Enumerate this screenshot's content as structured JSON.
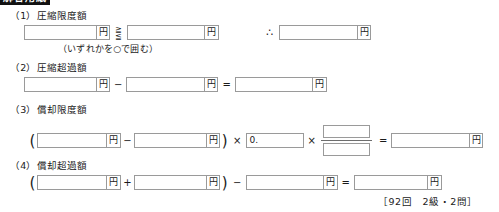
{
  "header": {
    "band_label": "解答用紙"
  },
  "worksheet": {
    "currency_unit": "円",
    "decimal_prefix": "0.",
    "choice_glyph_top": "≧",
    "choice_glyph_bottom": "≦",
    "therefore_symbol": "∴",
    "minus": "−",
    "plus": "+",
    "times": "×",
    "equals": "=",
    "paren_open": "(",
    "paren_close": ")",
    "sections": [
      {
        "number": "（1）",
        "title": "圧縮限度額",
        "note": "（いずれかを○で囲む）"
      },
      {
        "number": "（2）",
        "title": "圧縮超過額"
      },
      {
        "number": "（3）",
        "title": "償却限度額"
      },
      {
        "number": "（4）",
        "title": "償却超過額"
      }
    ]
  },
  "footer": {
    "reference": "［92回　2級・2問］"
  }
}
